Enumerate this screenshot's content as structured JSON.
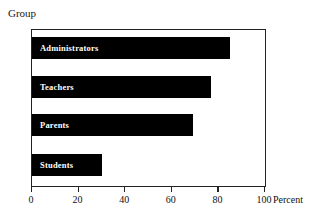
{
  "chart_data": {
    "type": "bar",
    "orientation": "horizontal",
    "title": "",
    "xlabel": "Percent",
    "ylabel": "Group",
    "categories": [
      "Administrators",
      "Teachers",
      "Parents",
      "Students"
    ],
    "values": [
      85,
      77,
      69,
      30
    ],
    "xlim": [
      0,
      100
    ],
    "xticks": [
      0,
      20,
      40,
      60,
      80,
      100
    ],
    "xtick_labels": [
      "0",
      "20",
      "40",
      "60",
      "80",
      "100"
    ],
    "grid": false,
    "legend": false,
    "bar_color": "#000000",
    "label_color": "#ffffff",
    "axis_color": "#222222",
    "background": "#ffffff"
  },
  "axes": {
    "y_caption": "Group",
    "x_caption": "Percent"
  },
  "bars": [
    {
      "label": "Administrators",
      "value": 85
    },
    {
      "label": "Teachers",
      "value": 77
    },
    {
      "label": "Parents",
      "value": 69
    },
    {
      "label": "Students",
      "value": 30
    }
  ],
  "ticks": [
    {
      "label": "0",
      "value": 0
    },
    {
      "label": "20",
      "value": 20
    },
    {
      "label": "40",
      "value": 40
    },
    {
      "label": "60",
      "value": 60
    },
    {
      "label": "80",
      "value": 80
    },
    {
      "label": "100",
      "value": 100
    }
  ]
}
